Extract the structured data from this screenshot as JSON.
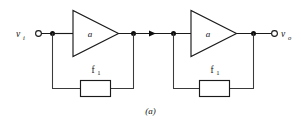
{
  "figure": {
    "caption": "(a)",
    "canvas": {
      "width": 301,
      "height": 123
    }
  },
  "colors": {
    "wire": "#1a1a1a",
    "background": "#ffffff",
    "node": "#0d0d0d",
    "text": "#111111"
  },
  "terminals": {
    "input": {
      "label_base": "v",
      "label_sub": "i"
    },
    "output": {
      "label_base": "v",
      "label_sub": "o"
    }
  },
  "stages": [
    {
      "name": "stage-1",
      "amplifier": {
        "label": "a"
      },
      "feedback": {
        "label_base": "f",
        "label_sub": "1"
      }
    },
    {
      "name": "stage-2",
      "amplifier": {
        "label": "a"
      },
      "feedback": {
        "label_base": "f",
        "label_sub": "1"
      }
    }
  ]
}
